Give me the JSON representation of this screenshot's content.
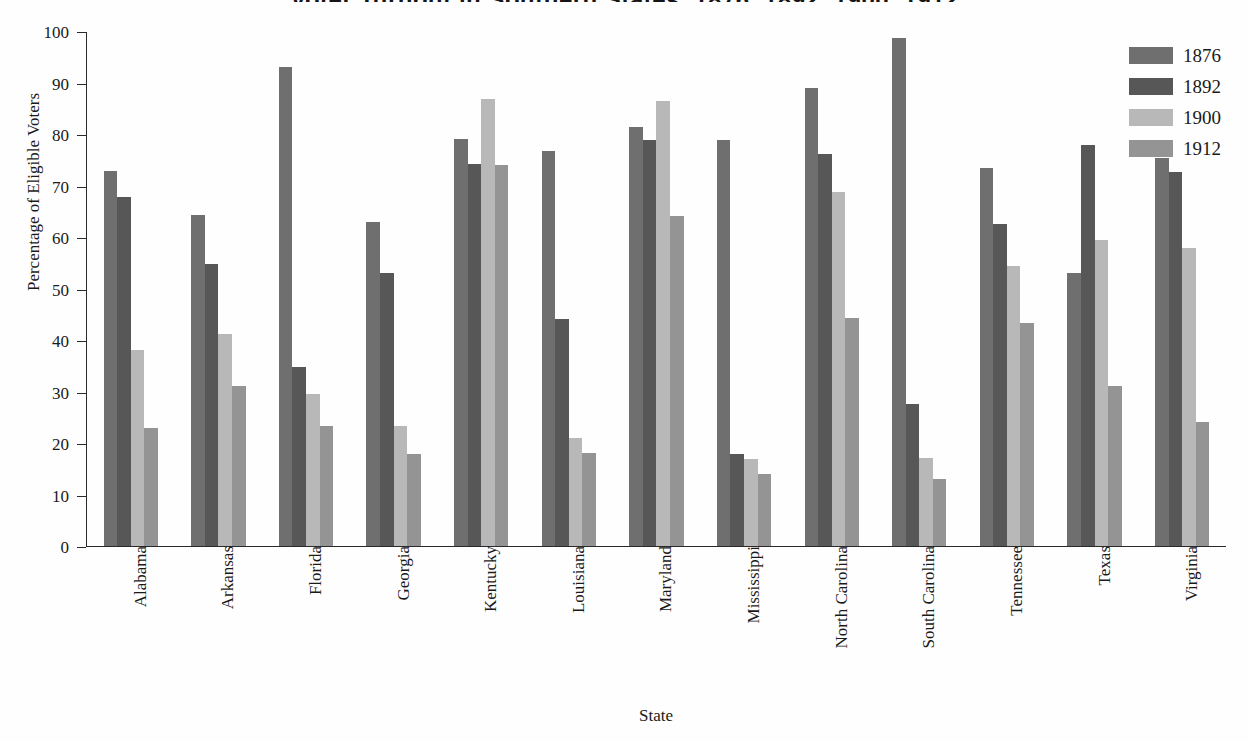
{
  "chart_data": {
    "type": "bar",
    "title": "Voter Turnout in Southern States, 1876, 1892, 1900, 1912",
    "xlabel": "State",
    "ylabel": "Percentage of Eligible Voters",
    "ylim": [
      0,
      100
    ],
    "yticks": [
      0,
      10,
      20,
      30,
      40,
      50,
      60,
      70,
      80,
      90,
      100
    ],
    "grid": false,
    "legend_position": "top-right",
    "categories": [
      "Alabama",
      "Arkansas",
      "Florida",
      "Georgia",
      "Kentucky",
      "Louisiana",
      "Maryland",
      "Mississippi",
      "North Carolina",
      "South Carolina",
      "Tennessee",
      "Texas",
      "Virginia"
    ],
    "series": [
      {
        "name": "1876",
        "color": "#6f6f6f",
        "values": [
          72.8,
          64.3,
          93.0,
          63.0,
          79.0,
          76.7,
          81.3,
          78.8,
          88.9,
          98.6,
          73.4,
          53.0,
          75.3
        ]
      },
      {
        "name": "1892",
        "color": "#575757",
        "values": [
          67.8,
          54.7,
          34.8,
          53.0,
          74.2,
          44.0,
          78.8,
          17.9,
          76.2,
          27.5,
          62.5,
          77.8,
          72.6
        ]
      },
      {
        "name": "1900",
        "color": "#b8b8b8",
        "values": [
          38.0,
          41.2,
          29.5,
          23.3,
          86.8,
          21.0,
          86.4,
          16.9,
          68.8,
          17.0,
          54.4,
          59.5,
          57.9
        ]
      },
      {
        "name": "1912",
        "color": "#949494",
        "values": [
          23.0,
          31.0,
          23.3,
          17.8,
          74.0,
          18.0,
          64.0,
          14.0,
          44.2,
          13.1,
          43.3,
          31.0,
          24.0
        ]
      }
    ]
  }
}
